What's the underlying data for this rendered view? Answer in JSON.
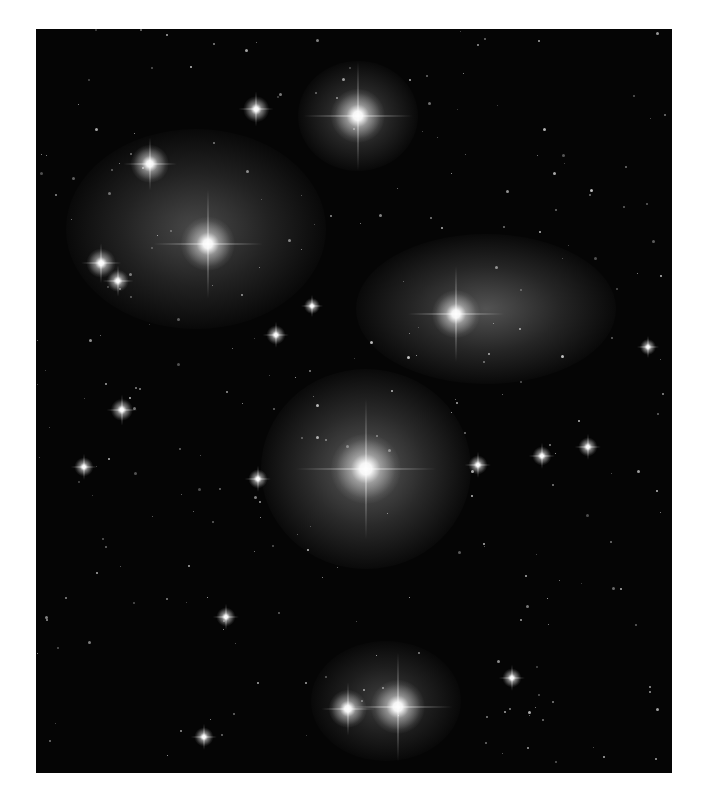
{
  "image": {
    "subject": "Pleiades star cluster (grayscale astrophotograph)",
    "frame": {
      "left": 36,
      "top": 29,
      "width": 636,
      "height": 744,
      "background": "#050505",
      "page_background": "#ffffff"
    },
    "bright_stars": [
      {
        "name": "star-top-center",
        "x": 322,
        "y": 87,
        "size": 34
      },
      {
        "name": "star-upper-left",
        "x": 114,
        "y": 135,
        "size": 24
      },
      {
        "name": "star-top-left-small",
        "x": 220,
        "y": 80,
        "size": 16
      },
      {
        "name": "star-left-cluster-main",
        "x": 172,
        "y": 215,
        "size": 34
      },
      {
        "name": "star-far-left-a",
        "x": 65,
        "y": 234,
        "size": 18
      },
      {
        "name": "star-far-left-b",
        "x": 82,
        "y": 252,
        "size": 14
      },
      {
        "name": "star-right-nebula",
        "x": 420,
        "y": 285,
        "size": 30
      },
      {
        "name": "star-center-main",
        "x": 330,
        "y": 440,
        "size": 44
      },
      {
        "name": "star-bottom-right",
        "x": 362,
        "y": 678,
        "size": 34
      },
      {
        "name": "star-bottom-left",
        "x": 312,
        "y": 680,
        "size": 24
      },
      {
        "name": "star-mid-left",
        "x": 86,
        "y": 381,
        "size": 14
      },
      {
        "name": "star-mid",
        "x": 240,
        "y": 306,
        "size": 12
      },
      {
        "name": "star-small-a",
        "x": 276,
        "y": 277,
        "size": 10
      },
      {
        "name": "star-right-a",
        "x": 506,
        "y": 427,
        "size": 12
      },
      {
        "name": "star-right-b",
        "x": 552,
        "y": 418,
        "size": 12
      },
      {
        "name": "star-right-c",
        "x": 442,
        "y": 436,
        "size": 12
      },
      {
        "name": "star-left-d",
        "x": 48,
        "y": 438,
        "size": 12
      },
      {
        "name": "star-mid-e",
        "x": 222,
        "y": 450,
        "size": 12
      },
      {
        "name": "star-lower-f",
        "x": 190,
        "y": 588,
        "size": 12
      },
      {
        "name": "star-lower-g",
        "x": 476,
        "y": 649,
        "size": 12
      },
      {
        "name": "star-lower-h",
        "x": 168,
        "y": 708,
        "size": 12
      },
      {
        "name": "star-far-right",
        "x": 612,
        "y": 318,
        "size": 10
      }
    ],
    "nebulae": [
      {
        "name": "nebula-top-center",
        "x": 322,
        "y": 87,
        "w": 120,
        "h": 110,
        "opacity": 0.35
      },
      {
        "name": "nebula-left-cluster",
        "x": 160,
        "y": 200,
        "w": 260,
        "h": 200,
        "opacity": 0.35
      },
      {
        "name": "nebula-right",
        "x": 450,
        "y": 280,
        "w": 260,
        "h": 150,
        "opacity": 0.4
      },
      {
        "name": "nebula-center",
        "x": 330,
        "y": 440,
        "w": 210,
        "h": 200,
        "opacity": 0.45
      },
      {
        "name": "nebula-bottom",
        "x": 350,
        "y": 672,
        "w": 150,
        "h": 120,
        "opacity": 0.3
      }
    ]
  }
}
